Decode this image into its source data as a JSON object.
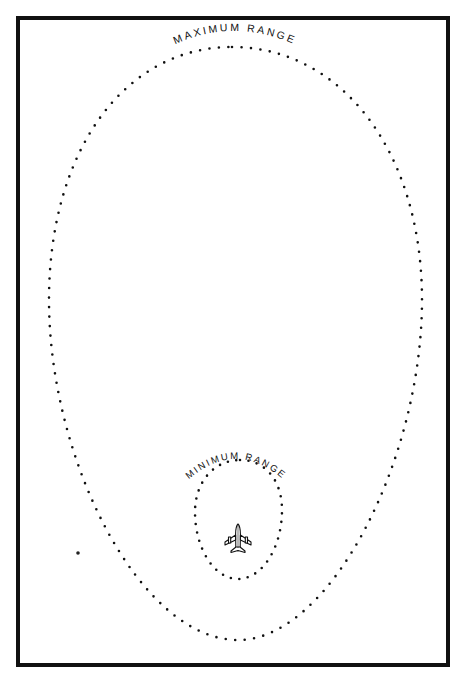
{
  "diagram": {
    "labels": {
      "maximum_range": "MAXIMUM RANGE",
      "minimum_range": "MINIMUM RANGE"
    },
    "icons": {
      "aircraft": "aircraft-top-view-icon"
    },
    "colors": {
      "ink": "#111111",
      "paper": "#ffffff"
    },
    "shapes": {
      "maximum_range_boundary": {
        "style": "dotted",
        "top": 47,
        "bottom": 640,
        "left": 49,
        "right": 422
      },
      "minimum_range_boundary": {
        "style": "dotted",
        "top": 460,
        "bottom": 580,
        "left": 195,
        "right": 282
      },
      "aircraft_position": {
        "x": 238,
        "y": 538
      }
    }
  }
}
